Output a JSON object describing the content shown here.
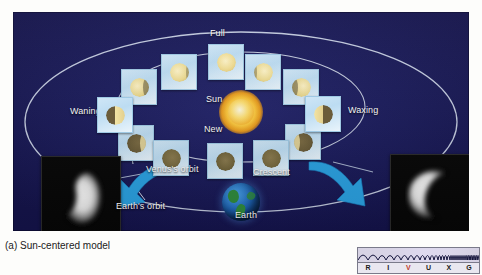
{
  "figure": {
    "caption": "(a) Sun-centered model",
    "panel_background_color": "#1b1c5c"
  },
  "labels": {
    "full": "Full",
    "new": "New",
    "sun": "Sun",
    "waning": "Waning",
    "waxing": "Waxing",
    "crescent": "Crescent",
    "venus_orbit": "Venus's orbit",
    "earth_orbit": "Earth's orbit",
    "earth": "Earth"
  },
  "diagram": {
    "center_body": "Sun",
    "inner_orbit": "Venus's orbit",
    "outer_orbit": "Earth's orbit",
    "phase_tile_count": 12,
    "phase_tiles": [
      {
        "name": "full",
        "illumination": 1.0,
        "tone": "sunlit",
        "x": 195,
        "y": 32
      },
      {
        "name": "gibbous-waning-upper",
        "illumination": 0.85,
        "tone": "sunlit",
        "x": 148,
        "y": 42
      },
      {
        "name": "gibbous-waning",
        "illumination": 0.7,
        "tone": "sunlit",
        "x": 108,
        "y": 57
      },
      {
        "name": "quarter-waning",
        "illumination": 0.5,
        "tone": "mixed",
        "x": 84,
        "y": 85
      },
      {
        "name": "crescent-waning",
        "illumination": 0.3,
        "tone": "dark",
        "x": 105,
        "y": 113
      },
      {
        "name": "crescent-waning-low",
        "illumination": 0.15,
        "tone": "dark",
        "x": 140,
        "y": 128
      },
      {
        "name": "new",
        "illumination": 0.0,
        "tone": "dark",
        "x": 194,
        "y": 131
      },
      {
        "name": "crescent-waxing-low",
        "illumination": 0.15,
        "tone": "dark",
        "x": 240,
        "y": 128
      },
      {
        "name": "crescent-waxing",
        "illumination": 0.3,
        "tone": "dark",
        "x": 272,
        "y": 112
      },
      {
        "name": "quarter-waxing",
        "illumination": 0.5,
        "tone": "mixed",
        "x": 292,
        "y": 84
      },
      {
        "name": "gibbous-waxing",
        "illumination": 0.7,
        "tone": "sunlit",
        "x": 270,
        "y": 57
      },
      {
        "name": "gibbous-waxing-upper",
        "illumination": 0.85,
        "tone": "sunlit",
        "x": 232,
        "y": 42
      }
    ],
    "photos": [
      {
        "name": "venus-photo-left",
        "phase": "gibbous",
        "alt": "Telescope image of Venus, large gibbous disk"
      },
      {
        "name": "venus-photo-right",
        "phase": "crescent",
        "alt": "Telescope image of Venus, thin crescent"
      }
    ],
    "arrows": [
      {
        "name": "arrow-to-left-photo",
        "direction": "left",
        "color": "#2aa0e0"
      },
      {
        "name": "arrow-to-right-photo",
        "direction": "right",
        "color": "#2aa0e0"
      }
    ]
  },
  "spectrum_bar": {
    "bands": [
      "R",
      "I",
      "V",
      "U",
      "X",
      "G"
    ],
    "highlighted_band": "V",
    "highlight_color": "#c0392b",
    "label_color": "#1a1a1a"
  }
}
